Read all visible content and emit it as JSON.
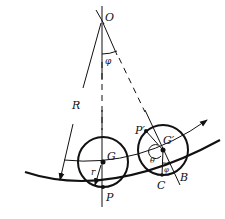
{
  "diagram": {
    "type": "physics-diagram",
    "labels": {
      "O": "O",
      "phi_top": "φ",
      "R": "R",
      "G": "G",
      "r": "r",
      "P": "P",
      "P_prime": "P′",
      "G_prime": "G′",
      "theta": "θ",
      "phi_small": "φ",
      "C": "C",
      "B": "B"
    },
    "colors": {
      "ink": "#111111",
      "background": "#ffffff"
    }
  }
}
